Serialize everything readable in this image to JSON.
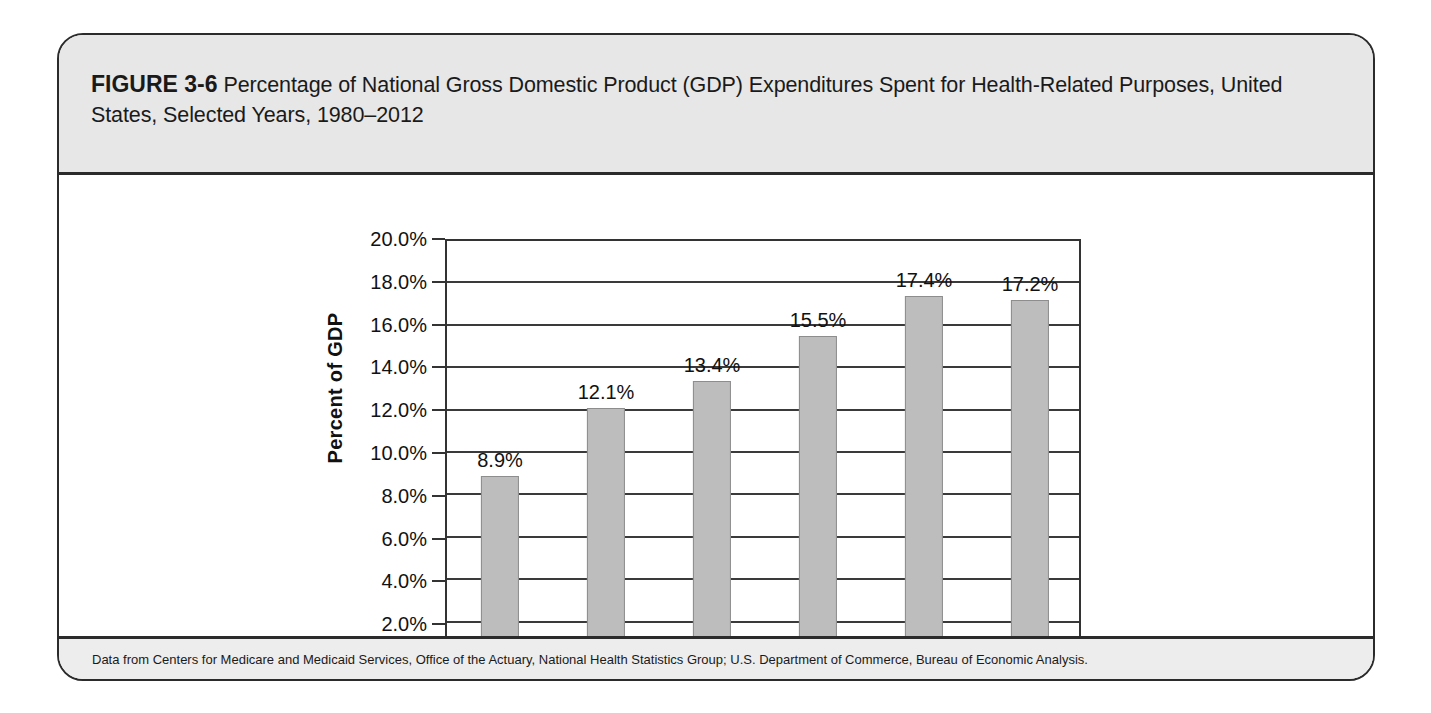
{
  "figure": {
    "label": "FIGURE 3-6",
    "caption": "Percentage of National Gross Domestic Product (GDP) Expenditures Spent for Health-Related Purposes, United States, Selected Years, 1980–2012",
    "source": "Data from Centers for Medicare and Medicaid Services, Office of the Actuary, National Health Statistics Group; U.S. Department of Commerce, Bureau of Economic Analysis."
  },
  "colors": {
    "bar_fill": "#bdbdbd",
    "bar_stroke": "#8d8d8d",
    "axis": "#333333",
    "band": "#e7e7e7",
    "text": "#111111"
  },
  "chart_data": {
    "type": "bar",
    "title": "Percentage of National Gross Domestic Product (GDP) Expenditures Spent for Health-Related Purposes, United States, Selected Years, 1980–2012",
    "xlabel": "",
    "ylabel": "Percent of GDP",
    "categories": [
      "1980",
      "1990",
      "2000",
      "2005",
      "2010",
      "2012"
    ],
    "values": [
      8.9,
      12.1,
      13.4,
      15.5,
      17.4,
      17.2
    ],
    "value_labels": [
      "8.9%",
      "12.1%",
      "13.4%",
      "15.5%",
      "17.4%",
      "17.2%"
    ],
    "ylim": [
      0,
      20
    ],
    "ytick_step": 2,
    "ytick_labels": [
      "20.0%",
      "18.0%",
      "16.0%",
      "14.0%",
      "12.0%",
      "10.0%",
      "8.0%",
      "6.0%",
      "4.0%",
      "2.0%",
      "0.0%"
    ],
    "ytick_values": [
      20,
      18,
      16,
      14,
      12,
      10,
      8,
      6,
      4,
      2,
      0
    ],
    "grid": true,
    "legend": false
  }
}
